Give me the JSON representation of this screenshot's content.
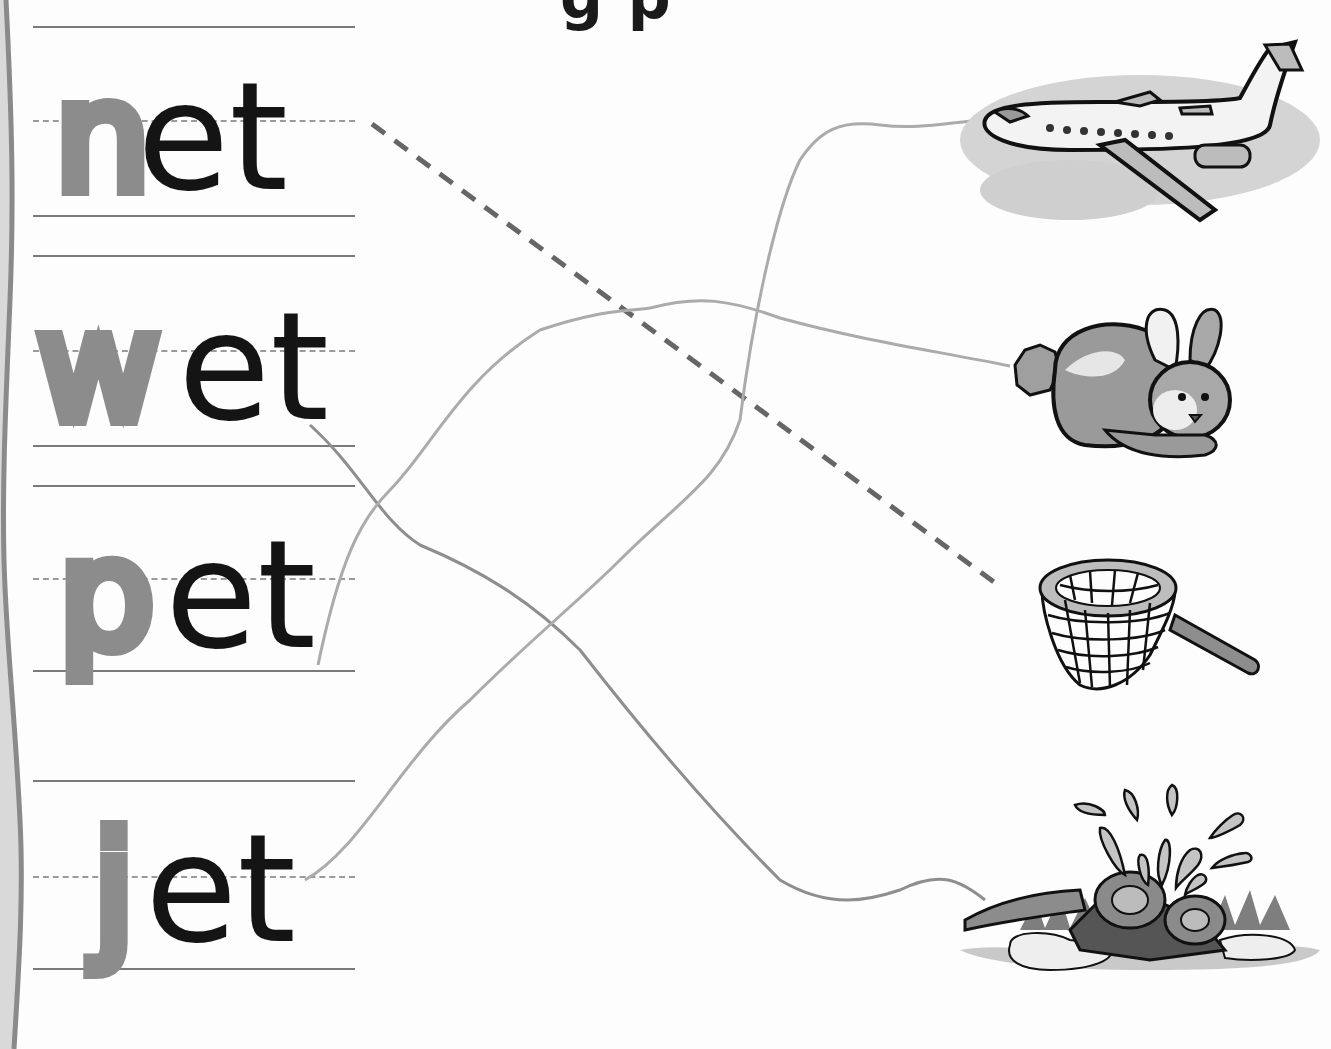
{
  "worksheet": {
    "title_fragment": "g p",
    "instruction": "Trace the first letter of each word, then draw a line from each word to its matching picture.",
    "words": [
      {
        "traced": "n",
        "rest": "et",
        "full": "net",
        "matches": "net"
      },
      {
        "traced": "w",
        "rest": "et",
        "full": "wet",
        "matches": "sprinkler"
      },
      {
        "traced": "p",
        "rest": "et",
        "full": "pet",
        "matches": "rabbit"
      },
      {
        "traced": "j",
        "rest": "et",
        "full": "jet",
        "matches": "airplane"
      }
    ],
    "pictures": [
      {
        "name": "airplane",
        "label": "jet airplane"
      },
      {
        "name": "rabbit",
        "label": "pet rabbit"
      },
      {
        "name": "net",
        "label": "butterfly net"
      },
      {
        "name": "sprinkler",
        "label": "wet lawn sprinkler"
      }
    ],
    "example_line": {
      "from": "net",
      "to": "net",
      "style": "dashed"
    },
    "drawn_lines": [
      {
        "from": "wet",
        "to": "sprinkler"
      },
      {
        "from": "pet",
        "to": "rabbit"
      },
      {
        "from": "jet",
        "to": "airplane"
      }
    ]
  },
  "colors": {
    "ink": "#141414",
    "trace_gray": "#8c8c8c",
    "guide_line": "#7a7a7a",
    "pencil": "#a5a5a5",
    "paper": "#fdfdfd"
  }
}
